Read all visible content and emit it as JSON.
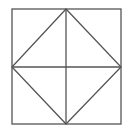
{
  "diagram": {
    "stroke_color": "#555555",
    "background": "#ffffff",
    "square": {
      "x1": 12,
      "y1": 9,
      "x2": 121,
      "y2": 124
    },
    "diamond": [
      [
        66,
        9
      ],
      [
        121,
        67
      ],
      [
        66,
        124
      ],
      [
        12,
        67
      ]
    ],
    "midlines": {
      "vertical": [
        [
          66,
          9
        ],
        [
          66,
          124
        ]
      ],
      "horizontal": [
        [
          12,
          67
        ],
        [
          121,
          67
        ]
      ]
    }
  }
}
